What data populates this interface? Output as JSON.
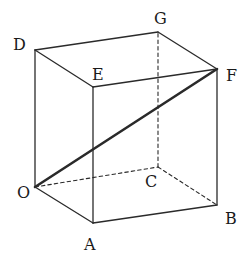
{
  "diagram": {
    "type": "cube",
    "vertices": {
      "O": {
        "label": "O",
        "x": 35,
        "y": 187,
        "lx": 17,
        "ly": 198
      },
      "A": {
        "label": "A",
        "x": 93,
        "y": 223,
        "lx": 84,
        "ly": 250
      },
      "B": {
        "label": "B",
        "x": 217,
        "y": 205,
        "lx": 225,
        "ly": 224
      },
      "C": {
        "label": "C",
        "x": 158,
        "y": 167,
        "lx": 145,
        "ly": 187
      },
      "D": {
        "label": "D",
        "x": 35,
        "y": 50,
        "lx": 13,
        "ly": 50
      },
      "E": {
        "label": "E",
        "x": 93,
        "y": 87,
        "lx": 92,
        "ly": 80
      },
      "F": {
        "label": "F",
        "x": 217,
        "y": 69,
        "lx": 226,
        "ly": 81
      },
      "G": {
        "label": "G",
        "x": 158,
        "y": 32,
        "lx": 154,
        "ly": 24
      }
    },
    "solid_edges": [
      [
        "O",
        "A"
      ],
      [
        "A",
        "B"
      ],
      [
        "O",
        "D"
      ],
      [
        "A",
        "E"
      ],
      [
        "B",
        "F"
      ],
      [
        "D",
        "E"
      ],
      [
        "E",
        "F"
      ],
      [
        "D",
        "G"
      ],
      [
        "G",
        "F"
      ]
    ],
    "dashed_edges": [
      [
        "O",
        "C"
      ],
      [
        "C",
        "B"
      ],
      [
        "C",
        "G"
      ]
    ],
    "highlighted_edges": [
      [
        "O",
        "F"
      ]
    ],
    "stroke_color": "#2a2a2a"
  }
}
